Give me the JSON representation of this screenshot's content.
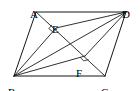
{
  "figure": {
    "type": "geometry-diagram",
    "shape": "parallelogram",
    "width": 140,
    "height": 91,
    "background_color": "#ffffff",
    "stroke_color": "#1a1a1a",
    "label_color": "#000000",
    "points": {
      "A": {
        "label": "A",
        "x": 36,
        "y": 12,
        "label_x": 30,
        "label_y": 9
      },
      "B": {
        "label": "B",
        "x": 14,
        "y": 76,
        "label_x": 8,
        "label_y": 87
      },
      "C": {
        "label": "C",
        "x": 105,
        "y": 76,
        "label_x": 101,
        "label_y": 87
      },
      "D": {
        "label": "D",
        "x": 126,
        "y": 12,
        "label_x": 122,
        "label_y": 9
      },
      "E": {
        "label": "E",
        "x": 56,
        "y": 28,
        "label_x": 52,
        "label_y": 24
      },
      "F": {
        "label": "F",
        "x": 85,
        "y": 56,
        "label_x": 76,
        "label_y": 68
      }
    },
    "segments": [
      {
        "name": "side-AB",
        "from": "A",
        "to": "B",
        "kind": "side"
      },
      {
        "name": "side-BC",
        "from": "B",
        "to": "C",
        "kind": "side"
      },
      {
        "name": "side-CD",
        "from": "C",
        "to": "D",
        "kind": "side"
      },
      {
        "name": "side-DA",
        "from": "D",
        "to": "A",
        "kind": "side"
      },
      {
        "name": "diagonal-AC",
        "from": "A",
        "to": "C",
        "kind": "diagonal"
      },
      {
        "name": "diagonal-BD",
        "from": "B",
        "to": "D",
        "kind": "diagonal"
      },
      {
        "name": "segment-BE",
        "from": "B",
        "to": "E",
        "kind": "perpendicular"
      },
      {
        "name": "segment-ED",
        "from": "E",
        "to": "D",
        "kind": "perpendicular"
      },
      {
        "name": "segment-BF",
        "from": "B",
        "to": "F",
        "kind": "perpendicular"
      },
      {
        "name": "segment-FD",
        "from": "F",
        "to": "D",
        "kind": "perpendicular"
      }
    ],
    "right_angles": [
      {
        "name": "right-angle-at-E",
        "at": "E",
        "size": 5
      },
      {
        "name": "right-angle-at-F",
        "at": "F",
        "size": 5
      }
    ]
  }
}
